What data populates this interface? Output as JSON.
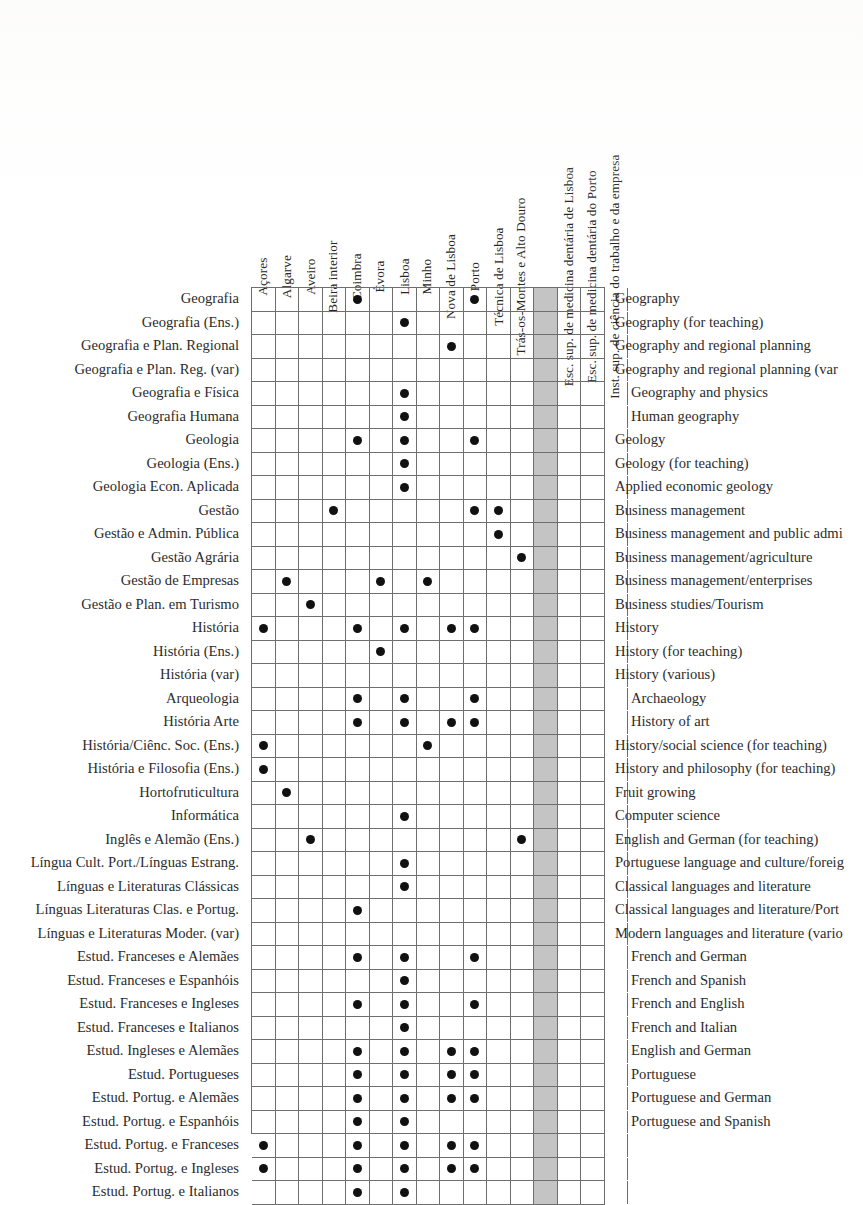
{
  "columns": [
    {
      "label": "Açores",
      "shaded": false
    },
    {
      "label": "Algarve",
      "shaded": false
    },
    {
      "label": "Aveiro",
      "shaded": false
    },
    {
      "label": "Beira interior",
      "shaded": false
    },
    {
      "label": "Coimbra",
      "shaded": false
    },
    {
      "label": "Évora",
      "shaded": false
    },
    {
      "label": "Lisboa",
      "shaded": false
    },
    {
      "label": "Minho",
      "shaded": false
    },
    {
      "label": "Nova de Lisboa",
      "shaded": false
    },
    {
      "label": "Porto",
      "shaded": false
    },
    {
      "label": "Técnica de Lisboa",
      "shaded": false
    },
    {
      "label": "Trás-os-Montes e Alto Douro",
      "shaded": false
    },
    {
      "label": "",
      "shaded": true
    },
    {
      "label": "Esc. sup. de medicina dentária de Lisboa",
      "shaded": false
    },
    {
      "label": "Esc. sup. de medicina dentária do Porto",
      "shaded": false
    },
    {
      "label": "Inst. sup. de ciência do trabalho e da empresa",
      "shaded": false
    }
  ],
  "rows": [
    {
      "pt": "Geografia",
      "en": "Geography",
      "indent": false,
      "marks": [
        4,
        9
      ]
    },
    {
      "pt": "Geografia (Ens.)",
      "en": "Geography (for teaching)",
      "indent": false,
      "marks": [
        6
      ]
    },
    {
      "pt": "Geografia e Plan. Regional",
      "en": "Geography and regional planning",
      "indent": false,
      "marks": [
        8
      ]
    },
    {
      "pt": "Geografia e Plan. Reg. (var)",
      "en": "Geography and regional planning (var",
      "indent": false,
      "marks": []
    },
    {
      "pt": "Geografia e Física",
      "en": "Geography and physics",
      "indent": true,
      "marks": [
        6
      ]
    },
    {
      "pt": "Geografia Humana",
      "en": "Human geography",
      "indent": true,
      "marks": [
        6
      ]
    },
    {
      "pt": "Geologia",
      "en": "Geology",
      "indent": false,
      "marks": [
        4,
        6,
        9
      ]
    },
    {
      "pt": "Geologia (Ens.)",
      "en": "Geology (for teaching)",
      "indent": false,
      "marks": [
        6
      ]
    },
    {
      "pt": "Geologia Econ. Aplicada",
      "en": "Applied economic geology",
      "indent": false,
      "marks": [
        6
      ]
    },
    {
      "pt": "Gestão",
      "en": "Business management",
      "indent": false,
      "marks": [
        3,
        9,
        10
      ]
    },
    {
      "pt": "Gestão e Admin. Pública",
      "en": "Business management and public admi",
      "indent": false,
      "marks": [
        10
      ]
    },
    {
      "pt": "Gestão Agrária",
      "en": "Business management/agriculture",
      "indent": false,
      "marks": [
        11
      ]
    },
    {
      "pt": "Gestão de Empresas",
      "en": "Business management/enterprises",
      "indent": false,
      "marks": [
        1,
        5,
        7
      ]
    },
    {
      "pt": "Gestão e Plan. em Turismo",
      "en": "Business studies/Tourism",
      "indent": false,
      "marks": [
        2
      ]
    },
    {
      "pt": "História",
      "en": "History",
      "indent": false,
      "marks": [
        0,
        4,
        6,
        8,
        9
      ]
    },
    {
      "pt": "História (Ens.)",
      "en": "History (for teaching)",
      "indent": false,
      "marks": [
        5
      ]
    },
    {
      "pt": "História (var)",
      "en": "History (various)",
      "indent": false,
      "marks": []
    },
    {
      "pt": "Arqueologia",
      "en": "Archaeology",
      "indent": true,
      "marks": [
        4,
        6,
        9
      ]
    },
    {
      "pt": "História Arte",
      "en": "History of art",
      "indent": true,
      "marks": [
        4,
        6,
        8,
        9
      ]
    },
    {
      "pt": "História/Ciênc. Soc. (Ens.)",
      "en": "History/social science (for teaching)",
      "indent": false,
      "marks": [
        0,
        7
      ]
    },
    {
      "pt": "História e Filosofia (Ens.)",
      "en": "History and philosophy (for teaching)",
      "indent": false,
      "marks": [
        0
      ]
    },
    {
      "pt": "Hortofruticultura",
      "en": "Fruit growing",
      "indent": false,
      "marks": [
        1
      ]
    },
    {
      "pt": "Informática",
      "en": "Computer science",
      "indent": false,
      "marks": [
        6
      ]
    },
    {
      "pt": "Inglês e Alemão (Ens.)",
      "en": "English and German (for teaching)",
      "indent": false,
      "marks": [
        2,
        11
      ]
    },
    {
      "pt": "Língua Cult. Port./Línguas Estrang.",
      "en": "Portuguese language and culture/foreig",
      "indent": false,
      "marks": [
        6
      ]
    },
    {
      "pt": "Línguas e Literaturas Clássicas",
      "en": "Classical languages and literature",
      "indent": false,
      "marks": [
        6
      ]
    },
    {
      "pt": "Línguas Literaturas Clas. e Portug.",
      "en": "Classical languages and literature/Port",
      "indent": false,
      "marks": [
        4
      ]
    },
    {
      "pt": "Línguas e Literaturas Moder. (var)",
      "en": "Modern languages and literature (vario",
      "indent": false,
      "marks": []
    },
    {
      "pt": "Estud. Franceses e Alemães",
      "en": "French and German",
      "indent": true,
      "marks": [
        4,
        6,
        9
      ]
    },
    {
      "pt": "Estud. Franceses e Espanhóis",
      "en": "French and Spanish",
      "indent": true,
      "marks": [
        6
      ]
    },
    {
      "pt": "Estud. Franceses e Ingleses",
      "en": "French and English",
      "indent": true,
      "marks": [
        4,
        6,
        9
      ]
    },
    {
      "pt": "Estud. Franceses e Italianos",
      "en": "French and Italian",
      "indent": true,
      "marks": [
        6
      ]
    },
    {
      "pt": "Estud. Ingleses e Alemães",
      "en": "English and German",
      "indent": true,
      "marks": [
        4,
        6,
        8,
        9
      ]
    },
    {
      "pt": "Estud. Portugueses",
      "en": "Portuguese",
      "indent": true,
      "marks": [
        4,
        6,
        8,
        9
      ]
    },
    {
      "pt": "Estud. Portug. e Alemães",
      "en": "Portuguese and German",
      "indent": true,
      "marks": [
        4,
        6,
        8,
        9
      ]
    },
    {
      "pt": "Estud. Portug. e Espanhóis",
      "en": "Portuguese and Spanish",
      "indent": true,
      "marks": [
        4,
        6
      ]
    },
    {
      "pt": "Estud. Portug. e Franceses",
      "en": "Portuguese and French",
      "indent": true,
      "marks": [
        0,
        4,
        6,
        8,
        9
      ]
    },
    {
      "pt": "Estud. Portug. e Ingleses",
      "en": "Portuguese and English",
      "indent": true,
      "marks": [
        0,
        4,
        6,
        8,
        9
      ]
    },
    {
      "pt": "Estud. Portug. e Italianos",
      "en": "Portuguese and Italian",
      "indent": true,
      "marks": [
        4,
        6
      ]
    }
  ],
  "style": {
    "ink": "#2b2b2b",
    "rule": "#6e6e6e",
    "dot": "#111111",
    "shaded_column": "#c4c4c4",
    "paper": "#ffffff"
  }
}
